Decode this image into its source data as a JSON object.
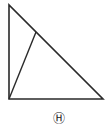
{
  "diagram": {
    "type": "right-triangle",
    "vertices": {
      "top": [
        9,
        5
      ],
      "bottom_left": [
        9,
        99
      ],
      "bottom_right": [
        103,
        99
      ]
    },
    "inner_segment": {
      "from": [
        9,
        99
      ],
      "to": [
        36,
        32
      ]
    },
    "stroke_color": "#2a2a2a",
    "label": "Ⓗ"
  }
}
